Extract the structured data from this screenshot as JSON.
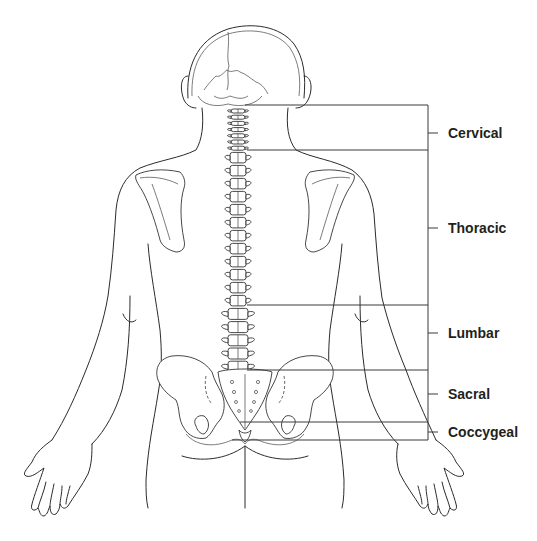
{
  "figure": {
    "labels": [
      {
        "id": "cervical",
        "text": "Cervical",
        "y": 133
      },
      {
        "id": "thoracic",
        "text": "Thoracic",
        "y": 228
      },
      {
        "id": "lumbar",
        "text": "Lumbar",
        "y": 333
      },
      {
        "id": "sacral",
        "text": "Sacral",
        "y": 394
      },
      {
        "id": "coccygeal",
        "text": "Coccygeal",
        "y": 432
      }
    ],
    "colors": {
      "line": "#2b2b2b",
      "text": "#231f20",
      "background": "#ffffff"
    }
  }
}
